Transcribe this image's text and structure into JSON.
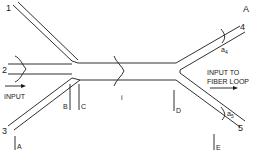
{
  "figure": {
    "panel_label": "A",
    "ports": [
      {
        "id": "1",
        "label": "1"
      },
      {
        "id": "2",
        "label": "2"
      },
      {
        "id": "3",
        "label": "3"
      },
      {
        "id": "4",
        "label": "4"
      },
      {
        "id": "5",
        "label": "5"
      }
    ],
    "reference_planes": [
      "A",
      "B",
      "C",
      "D",
      "E"
    ],
    "input_label": "INPUT",
    "output_label_line1": "INPUT TO",
    "output_label_line2": "FIBER LOOP",
    "center_mode_label": "i",
    "amplitude_labels": {
      "a4": {
        "base": "a",
        "sub": "4"
      },
      "a5": {
        "base": "a",
        "sub": "5"
      }
    }
  }
}
